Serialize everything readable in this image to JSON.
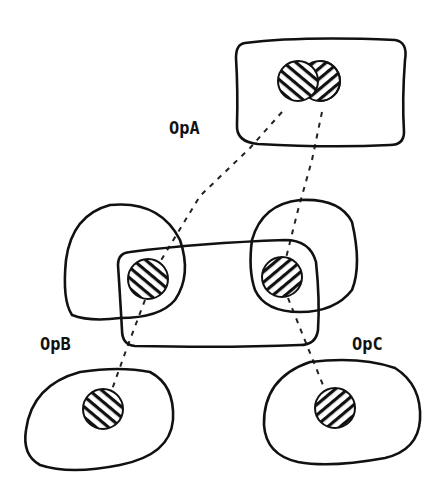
{
  "diagram": {
    "labels": {
      "opA": "OpA",
      "opB": "OpB",
      "opC": "OpC"
    },
    "nodes": [
      {
        "id": "opA-region",
        "label": "OpA",
        "shape": "rounded-rectangle",
        "contains": [
          "circle-a1",
          "circle-a2"
        ]
      },
      {
        "id": "middle-region",
        "shape": "rounded-rectangle",
        "contains": [
          "circle-b-mid",
          "circle-c-mid"
        ]
      },
      {
        "id": "left-blob",
        "shape": "blob",
        "contains": [
          "circle-b-mid"
        ]
      },
      {
        "id": "right-blob",
        "shape": "blob",
        "contains": [
          "circle-c-mid"
        ]
      },
      {
        "id": "opB-region",
        "label": "OpB",
        "shape": "blob",
        "contains": [
          "circle-b-bottom"
        ]
      },
      {
        "id": "opC-region",
        "label": "OpC",
        "shape": "blob",
        "contains": [
          "circle-c-bottom"
        ]
      }
    ],
    "edges": [
      {
        "from": "circle-a1",
        "to": "circle-b-mid",
        "style": "dashed"
      },
      {
        "from": "circle-a2",
        "to": "circle-c-mid",
        "style": "dashed"
      },
      {
        "from": "circle-b-mid",
        "to": "circle-b-bottom",
        "style": "dashed"
      },
      {
        "from": "circle-c-mid",
        "to": "circle-c-bottom",
        "style": "dashed"
      }
    ],
    "colors": {
      "ink": "#111111",
      "background": "#ffffff"
    }
  }
}
